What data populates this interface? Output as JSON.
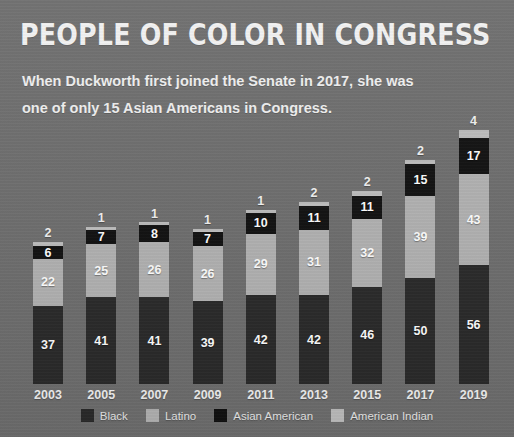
{
  "header": {
    "title": "PEOPLE OF COLOR IN CONGRESS",
    "arrow_icon": "left-arrowhead-icon",
    "subtitle": "When Duckworth first joined the Senate in 2017, she was one of only 15 Asian Americans in Congress."
  },
  "colors": {
    "background": "#6e6e6e",
    "black": "#2a2a2a",
    "latino": "#b2b2b2",
    "asian_american": "#101010",
    "american_indian": "#bdbdbd",
    "text": "#f2f2f2"
  },
  "legend": {
    "items": [
      {
        "label": "Black",
        "color": "#2a2a2a"
      },
      {
        "label": "Latino",
        "color": "#b2b2b2"
      },
      {
        "label": "Asian American",
        "color": "#101010"
      },
      {
        "label": "American Indian",
        "color": "#bdbdbd"
      }
    ]
  },
  "chart_data": {
    "type": "bar",
    "stacked": true,
    "title": "PEOPLE OF COLOR IN CONGRESS",
    "subtitle": "When Duckworth first joined the Senate in 2017, she was one of only 15 Asian Americans in Congress.",
    "xlabel": "",
    "ylabel": "",
    "grid": false,
    "legend_position": "bottom",
    "categories": [
      "2003",
      "2005",
      "2007",
      "2009",
      "2011",
      "2013",
      "2015",
      "2017",
      "2019"
    ],
    "series": [
      {
        "name": "Black",
        "color": "#2a2a2a",
        "values": [
          37,
          41,
          41,
          39,
          42,
          42,
          46,
          50,
          56
        ]
      },
      {
        "name": "Latino",
        "color": "#b2b2b2",
        "values": [
          22,
          25,
          26,
          26,
          29,
          31,
          32,
          39,
          43
        ]
      },
      {
        "name": "Asian American",
        "color": "#101010",
        "values": [
          6,
          7,
          8,
          7,
          10,
          11,
          11,
          15,
          17
        ]
      },
      {
        "name": "American Indian",
        "color": "#bdbdbd",
        "values": [
          2,
          1,
          1,
          1,
          1,
          2,
          2,
          2,
          4
        ]
      }
    ],
    "totals": [
      67,
      74,
      76,
      73,
      82,
      86,
      91,
      106,
      120
    ],
    "ylim": [
      0,
      120
    ],
    "value_labels_shown": true,
    "top_segment_labels_outside": true
  }
}
